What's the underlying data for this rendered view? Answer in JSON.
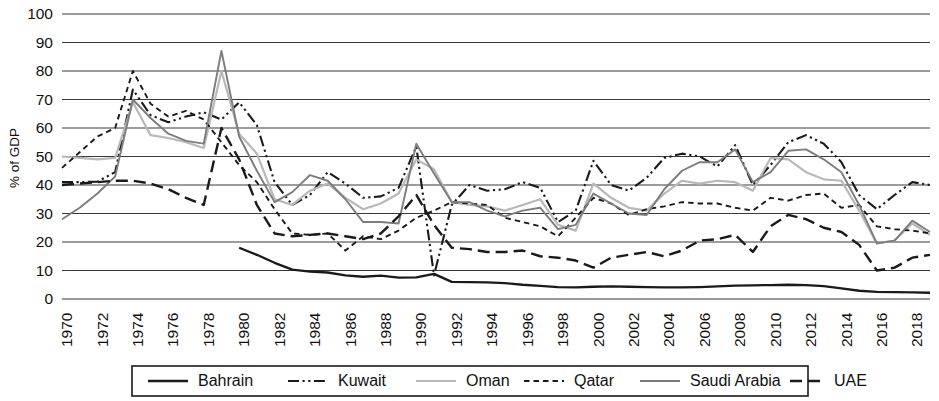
{
  "chart_data": {
    "type": "line",
    "title": "",
    "subtitle": "",
    "xlabel": "",
    "ylabel": "% of GDP",
    "ylim": [
      0,
      100
    ],
    "xlim": [
      1970,
      2019
    ],
    "ytick_step": 10,
    "yticks": [
      "0",
      "10",
      "20",
      "30",
      "40",
      "50",
      "60",
      "70",
      "80",
      "90",
      "100"
    ],
    "xticks": [
      "1970",
      "1972",
      "1974",
      "1976",
      "1978",
      "1980",
      "1982",
      "1984",
      "1986",
      "1988",
      "1990",
      "1992",
      "1994",
      "1996",
      "1998",
      "2000",
      "2002",
      "2004",
      "2006",
      "2008",
      "2010",
      "2012",
      "2014",
      "2016",
      "2018"
    ],
    "xtick_step": 2,
    "grid": "horizontal",
    "legend_position": "bottom",
    "x": [
      1970,
      1971,
      1972,
      1973,
      1974,
      1975,
      1976,
      1977,
      1978,
      1979,
      1980,
      1981,
      1982,
      1983,
      1984,
      1985,
      1986,
      1987,
      1988,
      1989,
      1990,
      1991,
      1992,
      1993,
      1994,
      1995,
      1996,
      1997,
      1998,
      1999,
      2000,
      2001,
      2002,
      2003,
      2004,
      2005,
      2006,
      2007,
      2008,
      2009,
      2010,
      2011,
      2012,
      2013,
      2014,
      2015,
      2016,
      2017,
      2018,
      2019
    ],
    "series": [
      {
        "name": "Bahrain",
        "color": "#1a1a1a",
        "width": 2.3,
        "dash": "none",
        "start_year": 1980,
        "values": [
          null,
          null,
          null,
          null,
          null,
          null,
          null,
          null,
          null,
          null,
          18.0,
          15.5,
          12.7,
          10.3,
          9.6,
          9.3,
          8.3,
          7.8,
          8.2,
          7.5,
          7.6,
          8.8,
          6.0,
          5.9,
          5.8,
          5.6,
          5.0,
          4.6,
          4.2,
          4.1,
          4.3,
          4.4,
          4.3,
          4.2,
          4.1,
          4.1,
          4.2,
          4.4,
          4.7,
          4.8,
          4.9,
          5.0,
          4.9,
          4.5,
          3.7,
          2.9,
          2.5,
          2.4,
          2.3,
          2.2
        ]
      },
      {
        "name": "Kuwait",
        "color": "#1a1a1a",
        "width": 2.1,
        "dash": "dashdotdot",
        "start_year": 1970,
        "values": [
          41.0,
          41.0,
          41.2,
          44.5,
          73.5,
          64.5,
          62.0,
          64.0,
          65.5,
          63.0,
          69.0,
          61.0,
          41.0,
          33.0,
          36.5,
          44.5,
          40.5,
          35.5,
          36.0,
          39.0,
          53.5,
          8.3,
          33.0,
          40.0,
          38.0,
          38.5,
          41.0,
          39.0,
          27.0,
          31.0,
          48.5,
          40.0,
          38.0,
          42.5,
          49.5,
          51.0,
          50.0,
          46.5,
          54.0,
          40.0,
          47.0,
          55.0,
          57.5,
          54.5,
          48.0,
          36.5,
          31.5,
          36.5,
          41.0,
          40.0
        ]
      },
      {
        "name": "Oman",
        "color": "#b8b8b8",
        "width": 2.2,
        "dash": "none",
        "start_year": 1970,
        "values": [
          50.0,
          49.5,
          49.0,
          49.5,
          69.0,
          57.5,
          56.5,
          55.0,
          53.0,
          80.0,
          58.0,
          51.0,
          35.0,
          33.0,
          38.0,
          40.5,
          35.5,
          31.5,
          33.5,
          37.0,
          49.0,
          45.5,
          34.0,
          33.0,
          32.5,
          31.0,
          33.0,
          35.0,
          26.0,
          24.0,
          40.5,
          35.5,
          32.0,
          31.0,
          37.0,
          41.5,
          40.5,
          41.5,
          41.0,
          38.0,
          49.5,
          49.0,
          44.5,
          42.0,
          41.5,
          31.0,
          19.5,
          20.5,
          26.5,
          22.5
        ]
      },
      {
        "name": "Qatar",
        "color": "#1a1a1a",
        "width": 1.9,
        "dash": "dash-short",
        "start_year": 1970,
        "values": [
          46.0,
          51.5,
          57.0,
          60.0,
          80.0,
          68.5,
          64.0,
          66.0,
          63.0,
          55.0,
          47.0,
          41.0,
          31.5,
          23.0,
          22.5,
          23.0,
          17.0,
          22.0,
          21.0,
          24.0,
          28.5,
          31.0,
          34.0,
          33.5,
          33.0,
          28.5,
          27.0,
          25.5,
          22.0,
          28.5,
          35.5,
          33.5,
          29.5,
          31.5,
          32.5,
          34.0,
          33.5,
          33.5,
          32.0,
          31.0,
          35.5,
          34.5,
          36.5,
          37.0,
          32.0,
          33.0,
          25.5,
          24.5,
          24.0,
          23.0
        ]
      },
      {
        "name": "Saudi Arabia",
        "color": "#7d7d7d",
        "width": 1.9,
        "dash": "none",
        "start_year": 1970,
        "values": [
          28.0,
          32.0,
          37.0,
          43.0,
          70.0,
          63.5,
          58.0,
          55.5,
          54.5,
          87.0,
          57.0,
          45.0,
          34.0,
          37.5,
          43.5,
          41.5,
          35.0,
          27.0,
          27.0,
          26.5,
          54.5,
          44.0,
          34.0,
          34.0,
          31.0,
          29.0,
          31.0,
          32.0,
          24.5,
          26.0,
          37.0,
          33.5,
          30.0,
          29.5,
          38.5,
          45.0,
          48.0,
          48.0,
          52.5,
          41.0,
          44.5,
          52.0,
          52.5,
          49.0,
          44.5,
          33.0,
          19.5,
          20.5,
          27.5,
          23.5
        ]
      },
      {
        "name": "UAE",
        "color": "#1a1a1a",
        "width": 2.4,
        "dash": "dash-long",
        "start_year": 1970,
        "values": [
          40.0,
          40.5,
          41.0,
          41.5,
          41.5,
          40.5,
          38.5,
          35.5,
          33.0,
          60.0,
          49.0,
          33.0,
          23.0,
          22.0,
          22.5,
          23.0,
          22.0,
          21.0,
          23.0,
          29.0,
          36.5,
          26.0,
          18.0,
          17.5,
          16.5,
          16.5,
          17.0,
          15.0,
          14.5,
          13.5,
          11.0,
          14.5,
          15.5,
          16.5,
          15.0,
          17.0,
          20.5,
          21.0,
          22.5,
          16.5,
          25.5,
          29.5,
          28.0,
          25.0,
          23.5,
          19.0,
          10.0,
          11.0,
          14.5,
          15.5
        ]
      }
    ]
  },
  "legend": {
    "entries": [
      {
        "label": "Bahrain"
      },
      {
        "label": "Kuwait"
      },
      {
        "label": "Oman"
      },
      {
        "label": "Qatar"
      },
      {
        "label": "Saudi Arabia"
      },
      {
        "label": "UAE"
      }
    ]
  }
}
